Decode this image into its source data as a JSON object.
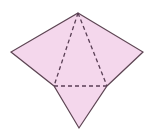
{
  "figure": {
    "name": "pyramid-net-diagram",
    "canvas": {
      "width": 156,
      "height": 137,
      "background": "#ffffff"
    },
    "style": {
      "fill_color": "#f4d7ec",
      "outline_color": "#5d4553",
      "dash_color": "#5a3f55",
      "outline_width": 1.2,
      "dash_width": 1.3,
      "dash_pattern": "4,3"
    },
    "vertices": {
      "top_apex": {
        "label": "top-apex",
        "x": 78,
        "y": 13
      },
      "left_vertex": {
        "label": "left-vertex",
        "x": 11,
        "y": 52
      },
      "right_vertex": {
        "label": "right-vertex",
        "x": 143,
        "y": 52
      },
      "inner_left": {
        "label": "inner-left",
        "x": 54,
        "y": 86
      },
      "inner_right": {
        "label": "inner-right",
        "x": 107,
        "y": 86
      },
      "bottom_apex": {
        "label": "bottom-apex",
        "x": 79,
        "y": 128
      }
    },
    "outline_path": "M 78 13 L 143 52 L 107 86 L 79 128 L 54 86 L 11 52 Z",
    "fold_lines": [
      {
        "name": "fold-line-left",
        "from": "top_apex",
        "to": "inner_left",
        "path": "M 78 13 L 54 86"
      },
      {
        "name": "fold-line-right",
        "from": "top_apex",
        "to": "inner_right",
        "path": "M 78 13 L 107 86"
      },
      {
        "name": "fold-line-horizontal",
        "from": "inner_left",
        "to": "inner_right",
        "path": "M 54 86 L 107 86"
      }
    ]
  }
}
